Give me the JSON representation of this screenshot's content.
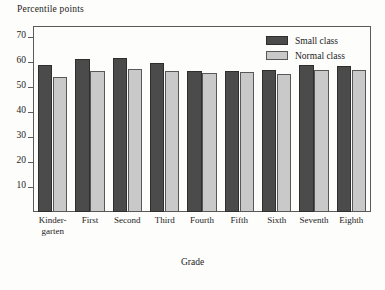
{
  "chart_data": {
    "type": "bar",
    "title": "",
    "ylabel": "Percentile points",
    "xlabel": "Grade",
    "categories": [
      "Kinder-garten",
      "First",
      "Second",
      "Third",
      "Fourth",
      "Fifth",
      "Sixth",
      "Seventh",
      "Eighth"
    ],
    "category_lines": [
      [
        "Kinder-",
        "garten"
      ],
      [
        "First",
        ""
      ],
      [
        "Second",
        ""
      ],
      [
        "Third",
        ""
      ],
      [
        "Fourth",
        ""
      ],
      [
        "Fifth",
        ""
      ],
      [
        "Sixth",
        ""
      ],
      [
        "Seventh",
        ""
      ],
      [
        "Eighth",
        ""
      ]
    ],
    "series": [
      {
        "name": "Small class",
        "color": "#4b4b4b",
        "values": [
          58.8,
          61.2,
          61.6,
          59.6,
          56.4,
          56.6,
          56.8,
          58.8,
          58.4
        ]
      },
      {
        "name": "Normal class",
        "color": "#c9c9c9",
        "values": [
          54.0,
          56.4,
          57.2,
          56.4,
          55.8,
          56.0,
          55.4,
          56.8,
          56.8
        ]
      }
    ],
    "ylim": [
      0,
      74
    ],
    "yticks": [
      10,
      20,
      30,
      40,
      50,
      60,
      70
    ],
    "ytick_labels": [
      "10",
      "20",
      "30",
      "40",
      "50",
      "60",
      "70"
    ],
    "grid": false,
    "legend_position": "top-right"
  },
  "legend": {
    "entries": [
      {
        "label": "Small class",
        "swatch": "dark-swatch"
      },
      {
        "label": "Normal class",
        "swatch": "light-swatch"
      }
    ]
  }
}
